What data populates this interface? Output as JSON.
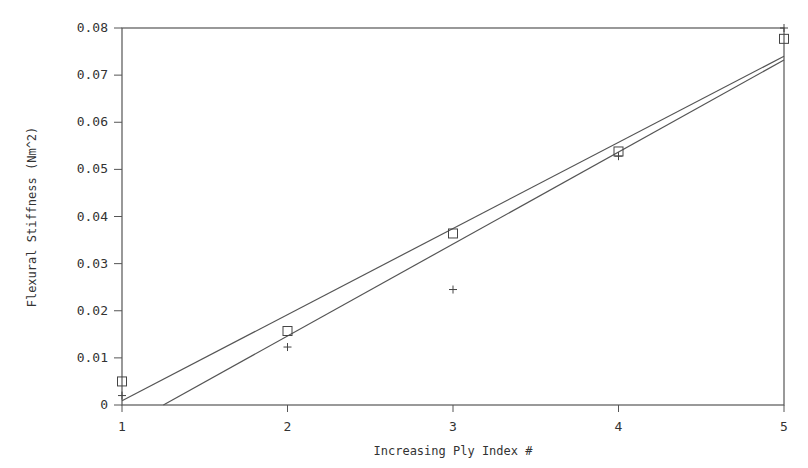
{
  "chart_data": {
    "type": "scatter",
    "title": "",
    "xlabel": "Increasing Ply Index #",
    "ylabel": "Flexural Stiffness (Nm^2)",
    "xlim": [
      1,
      5
    ],
    "ylim": [
      0,
      0.08
    ],
    "x_ticks": [
      "1",
      "2",
      "3",
      "4",
      "5"
    ],
    "y_ticks": [
      "0",
      "0.01",
      "0.02",
      "0.03",
      "0.04",
      "0.05",
      "0.06",
      "0.07",
      "0.08"
    ],
    "grid": false,
    "legend": null,
    "series": [
      {
        "name": "square markers",
        "marker": "square",
        "x": [
          1,
          2,
          3,
          4,
          5
        ],
        "y": [
          0.005,
          0.0157,
          0.0364,
          0.0538,
          0.0777
        ]
      },
      {
        "name": "plus markers",
        "marker": "plus",
        "x": [
          1,
          2,
          3,
          4,
          5
        ],
        "y": [
          0.002,
          0.0123,
          0.0245,
          0.0528,
          0.08
        ]
      },
      {
        "name": "fit line (square)",
        "type": "line",
        "x": [
          1,
          5
        ],
        "y": [
          0.0009,
          0.074
        ]
      },
      {
        "name": "fit line (plus)",
        "type": "line",
        "x": [
          1.25,
          5
        ],
        "y": [
          0.0,
          0.0732
        ]
      }
    ]
  }
}
